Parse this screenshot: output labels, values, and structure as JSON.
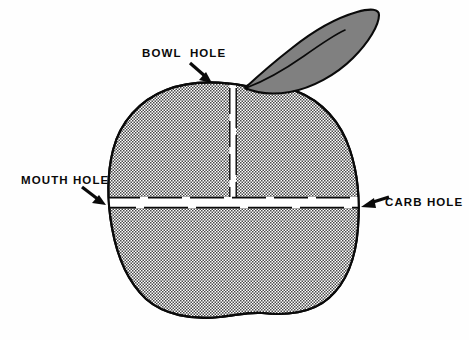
{
  "figure": {
    "background_color": "#fefefe",
    "outline_color": "#0a0a0a",
    "body_fill": "stipple-halftone-gray",
    "leaf_fill_color": "#808080",
    "hole_fill_color": "#ffffff"
  },
  "labels": {
    "bowl_hole": "BOWL  HOLE",
    "mouth_hole": "MOUTH HOLE",
    "carb_hole": "CARB HOLE"
  },
  "parts": {
    "leaf": "leaf",
    "stem": "stem",
    "body": "apple-body",
    "bowl_hole_slot": "vertical-bowl-channel",
    "mouth_carb_slot": "horizontal-mouth-carb-channel"
  },
  "annotations": [
    {
      "id": "bowl-hole",
      "label": "BOWL  HOLE",
      "label_x": 142,
      "label_y": 57,
      "arrow_from": [
        190,
        64
      ],
      "arrow_to": [
        211,
        83
      ],
      "direction": "down-right"
    },
    {
      "id": "mouth-hole",
      "label": "MOUTH HOLE",
      "label_x": 21,
      "label_y": 184,
      "arrow_from": [
        82,
        188
      ],
      "arrow_to": [
        106,
        205
      ],
      "direction": "down-right"
    },
    {
      "id": "carb-hole",
      "label": "CARB HOLE",
      "label_x": 385,
      "label_y": 205,
      "arrow_from": [
        389,
        197
      ],
      "arrow_to": [
        361,
        207
      ],
      "direction": "left"
    }
  ],
  "geometry": {
    "apple_bounds": {
      "left": 110,
      "top": 84,
      "right": 358,
      "bottom": 318
    },
    "vertical_slot": {
      "x": 230,
      "top": 86,
      "bottom": 196,
      "width": 5
    },
    "horizontal_slot": {
      "left": 112,
      "right": 357,
      "y": 198,
      "height": 10
    },
    "leaf_tip": [
      379,
      12
    ],
    "leaf_base": [
      246,
      86
    ]
  }
}
